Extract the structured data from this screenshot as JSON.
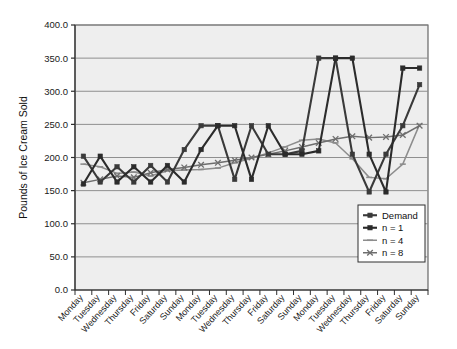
{
  "chart_data": {
    "type": "line",
    "title": "",
    "xlabel": "",
    "ylabel": "Pounds of Ice Cream Sold",
    "ylim": [
      0,
      400
    ],
    "ytick_step": 50,
    "ytick_labels": [
      "0.0",
      "50.0",
      "100.0",
      "150.0",
      "200.0",
      "250.0",
      "300.0",
      "350.0",
      "400.0"
    ],
    "grid": true,
    "legend_position": "bottom-right",
    "categories": [
      "Monday",
      "Tuesday",
      "Wednesday",
      "Thursday",
      "Friday",
      "Saturday",
      "Sunday",
      "Monday",
      "Tuesday",
      "Wednesday",
      "Thursday",
      "Friday",
      "Saturday",
      "Sunday",
      "Monday",
      "Tuesday",
      "Wednesday",
      "Thursday",
      "Friday",
      "Saturday",
      "Sunday"
    ],
    "series": [
      {
        "name": "Demand",
        "color": "#3a3a3a",
        "marker": "square",
        "width": 2.1,
        "values": [
          202,
          163,
          186,
          163,
          188,
          163,
          212,
          248,
          248,
          167,
          248,
          205,
          205,
          210,
          350,
          350,
          205,
          148,
          205,
          248,
          310
        ]
      },
      {
        "name": "n = 1",
        "color": "#2b2b2b",
        "marker": "square",
        "width": 2.1,
        "values": [
          160,
          202,
          163,
          186,
          163,
          188,
          163,
          212,
          248,
          248,
          167,
          248,
          205,
          205,
          210,
          350,
          350,
          205,
          148,
          335,
          335
        ]
      },
      {
        "name": "n = 4",
        "color": "#8d8d8d",
        "marker": "dash",
        "width": 1.5,
        "values": [
          190,
          186,
          176,
          178,
          172,
          180,
          181,
          182,
          184,
          192,
          199,
          207,
          216,
          226,
          228,
          222,
          198,
          170,
          168,
          190,
          250
        ]
      },
      {
        "name": "n = 8",
        "color": "#6e6e6e",
        "marker": "cross",
        "width": 1.5,
        "values": [
          162,
          167,
          172,
          170,
          177,
          182,
          185,
          189,
          192,
          196,
          200,
          205,
          210,
          216,
          222,
          228,
          232,
          230,
          231,
          234,
          248
        ]
      }
    ]
  },
  "legend": {
    "entries": [
      {
        "label": "Demand"
      },
      {
        "label": "n = 1"
      },
      {
        "label": "n = 4"
      },
      {
        "label": "n = 8"
      }
    ]
  }
}
